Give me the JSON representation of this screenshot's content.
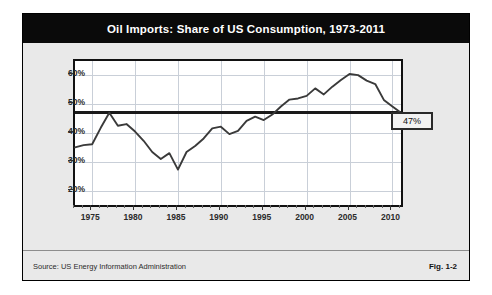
{
  "figure": {
    "title": "Oil Imports: Share of US Consumption, 1973-2011",
    "source": "Source:  US Energy Information Administration",
    "fig_number": "Fig. 1-2",
    "callout_label": "47%"
  },
  "colors": {
    "title_band": "#0a0a0a",
    "title_text": "#ffffff",
    "panel_background": "#e9e9e9",
    "plot_background": "#ffffff",
    "grid": "#c9cfd8",
    "series_line": "#3a3a3a",
    "reference_line": "#1a1a1a",
    "frame": "#111111"
  },
  "chart_data": {
    "type": "line",
    "title": "Oil Imports: Share of US Consumption, 1973-2011",
    "xlabel": "",
    "ylabel": "",
    "xlim": [
      1973,
      2011
    ],
    "ylim": [
      15,
      65
    ],
    "grid": true,
    "legend": "none",
    "y_ticks": [
      20,
      30,
      40,
      50,
      60
    ],
    "y_tick_labels": [
      "20%",
      "30%",
      "40%",
      "50%",
      "60%"
    ],
    "x_ticks": [
      1975,
      1980,
      1985,
      1990,
      1995,
      2000,
      2005,
      2010
    ],
    "x_tick_labels": [
      "1975",
      "1980",
      "1985",
      "1990",
      "1995",
      "2000",
      "2005",
      "2010"
    ],
    "x_minor_tick_interval": 1,
    "annotations": [
      {
        "label": "47%",
        "type": "horizontal-reference-line",
        "value": 47,
        "description": "Black horizontal line at 47% spanning plot width, labeled at right edge"
      }
    ],
    "series": [
      {
        "name": "Oil imports share of US consumption",
        "x": [
          1973,
          1974,
          1975,
          1976,
          1977,
          1978,
          1979,
          1980,
          1981,
          1982,
          1983,
          1984,
          1985,
          1986,
          1987,
          1988,
          1989,
          1990,
          1991,
          1992,
          1993,
          1994,
          1995,
          1996,
          1997,
          1998,
          1999,
          2000,
          2001,
          2002,
          2003,
          2004,
          2005,
          2006,
          2007,
          2008,
          2009,
          2010,
          2011
        ],
        "y": [
          35.0,
          35.8,
          36.1,
          41.8,
          47.0,
          42.5,
          43.1,
          40.5,
          37.3,
          33.4,
          31.0,
          33.0,
          27.3,
          33.4,
          35.5,
          38.1,
          41.6,
          42.2,
          39.6,
          40.7,
          44.2,
          45.7,
          44.5,
          46.4,
          49.2,
          51.6,
          52.0,
          52.9,
          55.5,
          53.4,
          56.1,
          58.4,
          60.5,
          60.1,
          58.2,
          57.0,
          51.5,
          49.2,
          47.0
        ]
      }
    ]
  }
}
